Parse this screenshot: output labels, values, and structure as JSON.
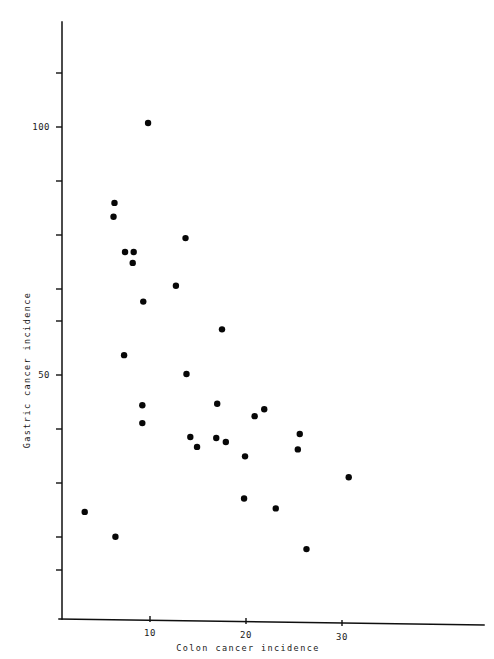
{
  "chart_data": {
    "type": "scatter",
    "title": "",
    "xlabel": "Colon cancer incidence",
    "ylabel": "Gastric cancer incidence",
    "xlim": [
      0,
      37
    ],
    "ylim": [
      0,
      127
    ],
    "grid": false,
    "legend": "none",
    "marker": {
      "shape": "circle",
      "color": "#070707",
      "size_px": 4.2
    },
    "x_ticks_labeled": [
      10,
      20,
      30
    ],
    "x_tick_labels": [
      "10",
      "20",
      "30"
    ],
    "y_ticks_labeled": [
      100,
      50
    ],
    "y_tick_labels": [
      "100",
      "50"
    ],
    "y_ticks_minor": [
      127,
      116,
      105,
      94,
      83,
      72,
      61,
      50,
      39,
      28,
      17,
      11
    ],
    "points": [
      {
        "x": 9.8,
        "y": 100.8
      },
      {
        "x": 6.3,
        "y": 84.7
      },
      {
        "x": 6.2,
        "y": 81.9
      },
      {
        "x": 13.7,
        "y": 77.6
      },
      {
        "x": 7.4,
        "y": 74.8
      },
      {
        "x": 8.3,
        "y": 74.8
      },
      {
        "x": 8.2,
        "y": 72.6
      },
      {
        "x": 12.7,
        "y": 68.0
      },
      {
        "x": 9.3,
        "y": 64.8
      },
      {
        "x": 17.5,
        "y": 59.2
      },
      {
        "x": 7.3,
        "y": 54.0
      },
      {
        "x": 13.8,
        "y": 50.2
      },
      {
        "x": 9.2,
        "y": 43.9
      },
      {
        "x": 9.2,
        "y": 40.3
      },
      {
        "x": 17.0,
        "y": 44.2
      },
      {
        "x": 20.9,
        "y": 41.7
      },
      {
        "x": 21.9,
        "y": 43.1
      },
      {
        "x": 14.2,
        "y": 37.5
      },
      {
        "x": 14.9,
        "y": 35.5
      },
      {
        "x": 16.9,
        "y": 37.3
      },
      {
        "x": 17.9,
        "y": 36.5
      },
      {
        "x": 19.9,
        "y": 33.6
      },
      {
        "x": 25.6,
        "y": 38.1
      },
      {
        "x": 25.4,
        "y": 35.0
      },
      {
        "x": 30.7,
        "y": 29.4
      },
      {
        "x": 19.8,
        "y": 25.1
      },
      {
        "x": 23.1,
        "y": 23.1
      },
      {
        "x": 3.2,
        "y": 22.4
      },
      {
        "x": 6.4,
        "y": 17.4
      },
      {
        "x": 26.3,
        "y": 14.9
      }
    ]
  },
  "axes": {
    "x_axis_name": "x-axis",
    "y_axis_name": "y-axis"
  }
}
